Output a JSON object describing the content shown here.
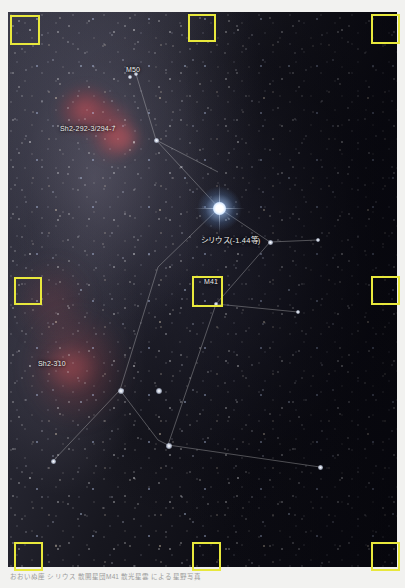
{
  "photo": {
    "subject": "Canis Major constellation wide-field astrophotograph",
    "labels": {
      "m50": "M50",
      "sh2_292": "Sh2-292-3/294-7",
      "sirius": "シリウス(-1.44等)",
      "m41": "M41",
      "sh2_310": "Sh2-310"
    }
  },
  "annotation": {
    "box_color": "#e8e83c",
    "count": 9,
    "boxes": [
      {
        "name": "anno-box-top-left",
        "x": 10,
        "y": 15,
        "w": 30,
        "h": 30
      },
      {
        "name": "anno-box-top-center",
        "x": 188,
        "y": 14,
        "w": 28,
        "h": 28
      },
      {
        "name": "anno-box-top-right",
        "x": 371,
        "y": 14,
        "w": 29,
        "h": 30
      },
      {
        "name": "anno-box-middle-left",
        "x": 14,
        "y": 277,
        "w": 28,
        "h": 28
      },
      {
        "name": "anno-box-m41-center",
        "x": 192,
        "y": 276,
        "w": 31,
        "h": 31
      },
      {
        "name": "anno-box-middle-right",
        "x": 371,
        "y": 276,
        "w": 29,
        "h": 29
      },
      {
        "name": "anno-box-bottom-left",
        "x": 14,
        "y": 542,
        "w": 29,
        "h": 29
      },
      {
        "name": "anno-box-bottom-center",
        "x": 192,
        "y": 542,
        "w": 29,
        "h": 29
      },
      {
        "name": "anno-box-bottom-right",
        "x": 371,
        "y": 542,
        "w": 29,
        "h": 29
      }
    ]
  },
  "caption": {
    "text": "おおいぬ座 シリウス 散開星団M41 散光星雲 による星野写真"
  },
  "colors": {
    "annotation_yellow": "#e8e83c",
    "sky_dark": "#0a0a12",
    "nebula_red": "#c44e56",
    "sirius_blue_white": "#cfe4ff",
    "label_text": "#f0f0ee",
    "page_background": "#ffffff"
  }
}
